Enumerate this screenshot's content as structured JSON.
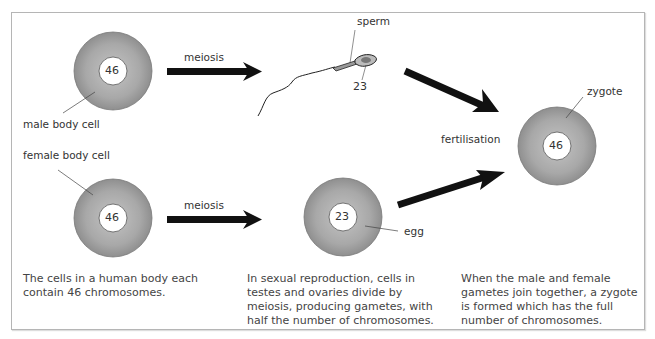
{
  "colors": {
    "cell_fill": "#a9a9a9",
    "nucleus_fill": "#ffffff",
    "arrow": "#111111",
    "frame": "#b5b5b5"
  },
  "cells": {
    "male_body_cell": {
      "label": "male body cell",
      "chromosomes": "46"
    },
    "female_body_cell": {
      "label": "female body cell",
      "chromosomes": "46"
    },
    "sperm": {
      "label": "sperm",
      "chromosomes": "23"
    },
    "egg": {
      "label": "egg",
      "chromosomes": "23"
    },
    "zygote": {
      "label": "zygote",
      "chromosomes": "46"
    }
  },
  "arrows": {
    "top_meiosis": "meiosis",
    "bottom_meiosis": "meiosis",
    "fertilisation": "fertilisation"
  },
  "captions": {
    "left": "The cells in a human body each contain 46 chromosomes.",
    "middle": "In sexual reproduction, cells in testes and ovaries divide by meiosis, producing gametes, with half the number of chromosomes.",
    "right": "When the male and female gametes join together, a zygote is formed which has the full number of chromosomes."
  }
}
